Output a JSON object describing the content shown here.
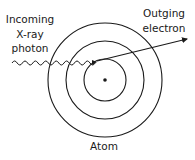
{
  "diagram": {
    "labels": {
      "incoming_line1": "Incoming",
      "incoming_line2": "X-ray",
      "incoming_line3": "photon",
      "outgoing_line1": "Outging",
      "outgoing_line2": "electron",
      "atom": "Atom"
    },
    "atom": {
      "center": [
        105,
        80
      ],
      "shell_radii": [
        21,
        39,
        57
      ],
      "nucleus_radius": 1.8
    },
    "photon": {
      "start": [
        12,
        63
      ],
      "end": [
        95,
        62
      ]
    },
    "electron": {
      "start": [
        97,
        61
      ],
      "end": [
        187,
        39
      ]
    },
    "colors": {
      "stroke": "#1a1a1a",
      "background": "#ffffff"
    }
  }
}
